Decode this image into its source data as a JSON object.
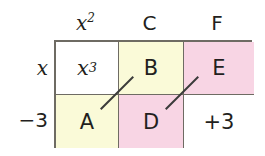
{
  "diagram": {
    "colors": {
      "white": "#ffffff",
      "yellow": "#fafad8",
      "pink": "#f8d5e4",
      "border": "#6e6b63",
      "text": "#231f20",
      "slash": "#3b3b3b"
    },
    "column_headers": [
      {
        "base": "x",
        "sup": "2"
      },
      {
        "base": "C",
        "sup": ""
      },
      {
        "base": "F",
        "sup": ""
      }
    ],
    "row_headers": [
      {
        "label": "x"
      },
      {
        "label": "−3"
      }
    ],
    "cells": [
      [
        {
          "base": "x",
          "sup": "3",
          "fill": "white",
          "italic": true
        },
        {
          "base": "B",
          "sup": "",
          "fill": "yellow",
          "italic": false
        },
        {
          "base": "E",
          "sup": "",
          "fill": "pink",
          "italic": false
        }
      ],
      [
        {
          "base": "A",
          "sup": "",
          "fill": "yellow",
          "italic": false
        },
        {
          "base": "D",
          "sup": "",
          "fill": "pink",
          "italic": false
        },
        {
          "base": "+3",
          "sup": "",
          "fill": "white",
          "italic": false
        }
      ]
    ],
    "slash_marks": [
      {
        "name": "diagonal-mark-left"
      },
      {
        "name": "diagonal-mark-right"
      }
    ]
  }
}
